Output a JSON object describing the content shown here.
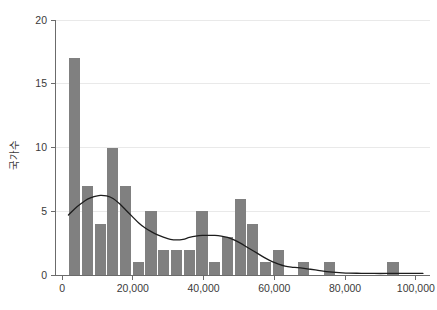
{
  "chart_data": {
    "type": "bar",
    "title": "",
    "subtitle": "",
    "xlabel": "",
    "ylabel": "국가수",
    "xlim": [
      -2000,
      104000
    ],
    "ylim": [
      0,
      20
    ],
    "grid": true,
    "legend": false,
    "bin_width": 3600,
    "bar_color": "#808080",
    "curve_color": "#1d1d1d",
    "xtick_values": [
      0,
      20000,
      40000,
      60000,
      80000,
      100000
    ],
    "xtick_labels": [
      "0",
      "20,000",
      "40,000",
      "60,000",
      "80,000",
      "100,000"
    ],
    "ytick_values": [
      0,
      5,
      10,
      15,
      20
    ],
    "ytick_labels": [
      "0",
      "5",
      "10",
      "15",
      "20"
    ],
    "bins": [
      {
        "x0": 1800,
        "x1": 5400,
        "count": 17
      },
      {
        "x0": 5400,
        "x1": 9000,
        "count": 7
      },
      {
        "x0": 9000,
        "x1": 12600,
        "count": 4
      },
      {
        "x0": 12600,
        "x1": 16200,
        "count": 10
      },
      {
        "x0": 16200,
        "x1": 19800,
        "count": 7
      },
      {
        "x0": 19800,
        "x1": 23400,
        "count": 1
      },
      {
        "x0": 23400,
        "x1": 27000,
        "count": 5
      },
      {
        "x0": 27000,
        "x1": 30600,
        "count": 2
      },
      {
        "x0": 30600,
        "x1": 34200,
        "count": 2
      },
      {
        "x0": 34200,
        "x1": 37800,
        "count": 2
      },
      {
        "x0": 37800,
        "x1": 41400,
        "count": 5
      },
      {
        "x0": 41400,
        "x1": 45000,
        "count": 1
      },
      {
        "x0": 45000,
        "x1": 48600,
        "count": 3
      },
      {
        "x0": 48600,
        "x1": 52200,
        "count": 6
      },
      {
        "x0": 52200,
        "x1": 55800,
        "count": 4
      },
      {
        "x0": 55800,
        "x1": 59400,
        "count": 1
      },
      {
        "x0": 59400,
        "x1": 63000,
        "count": 2
      },
      {
        "x0": 63000,
        "x1": 66600,
        "count": 0
      },
      {
        "x0": 66600,
        "x1": 70200,
        "count": 1
      },
      {
        "x0": 70200,
        "x1": 73800,
        "count": 0
      },
      {
        "x0": 73800,
        "x1": 77400,
        "count": 1
      },
      {
        "x0": 77400,
        "x1": 81000,
        "count": 0
      },
      {
        "x0": 81000,
        "x1": 84600,
        "count": 0
      },
      {
        "x0": 84600,
        "x1": 88200,
        "count": 0
      },
      {
        "x0": 88200,
        "x1": 91800,
        "count": 0
      },
      {
        "x0": 91800,
        "x1": 95400,
        "count": 1
      },
      {
        "x0": 95400,
        "x1": 99000,
        "count": 0
      }
    ],
    "density_curve": [
      {
        "x": 1800,
        "y": 4.7
      },
      {
        "x": 3600,
        "y": 5.2
      },
      {
        "x": 5400,
        "y": 5.6
      },
      {
        "x": 7200,
        "y": 5.95
      },
      {
        "x": 9000,
        "y": 6.15
      },
      {
        "x": 10800,
        "y": 6.25
      },
      {
        "x": 12600,
        "y": 6.2
      },
      {
        "x": 14400,
        "y": 6.0
      },
      {
        "x": 16200,
        "y": 5.6
      },
      {
        "x": 18000,
        "y": 5.1
      },
      {
        "x": 19800,
        "y": 4.6
      },
      {
        "x": 21600,
        "y": 4.1
      },
      {
        "x": 23400,
        "y": 3.7
      },
      {
        "x": 25200,
        "y": 3.4
      },
      {
        "x": 27000,
        "y": 3.15
      },
      {
        "x": 28800,
        "y": 2.95
      },
      {
        "x": 30600,
        "y": 2.8
      },
      {
        "x": 32400,
        "y": 2.75
      },
      {
        "x": 34200,
        "y": 2.8
      },
      {
        "x": 36000,
        "y": 2.95
      },
      {
        "x": 37800,
        "y": 3.05
      },
      {
        "x": 39600,
        "y": 3.1
      },
      {
        "x": 41400,
        "y": 3.1
      },
      {
        "x": 43200,
        "y": 3.1
      },
      {
        "x": 45000,
        "y": 3.05
      },
      {
        "x": 46800,
        "y": 2.95
      },
      {
        "x": 48600,
        "y": 2.75
      },
      {
        "x": 50400,
        "y": 2.5
      },
      {
        "x": 52200,
        "y": 2.2
      },
      {
        "x": 54000,
        "y": 1.9
      },
      {
        "x": 55800,
        "y": 1.6
      },
      {
        "x": 57600,
        "y": 1.3
      },
      {
        "x": 59400,
        "y": 1.05
      },
      {
        "x": 61200,
        "y": 0.85
      },
      {
        "x": 63000,
        "y": 0.7
      },
      {
        "x": 64800,
        "y": 0.62
      },
      {
        "x": 66600,
        "y": 0.58
      },
      {
        "x": 68400,
        "y": 0.52
      },
      {
        "x": 70200,
        "y": 0.45
      },
      {
        "x": 72000,
        "y": 0.38
      },
      {
        "x": 73800,
        "y": 0.3
      },
      {
        "x": 75600,
        "y": 0.24
      },
      {
        "x": 77400,
        "y": 0.2
      },
      {
        "x": 79200,
        "y": 0.17
      },
      {
        "x": 81000,
        "y": 0.15
      },
      {
        "x": 84600,
        "y": 0.13
      },
      {
        "x": 88200,
        "y": 0.12
      },
      {
        "x": 91800,
        "y": 0.12
      },
      {
        "x": 95400,
        "y": 0.12
      },
      {
        "x": 99000,
        "y": 0.12
      },
      {
        "x": 102000,
        "y": 0.12
      }
    ]
  }
}
